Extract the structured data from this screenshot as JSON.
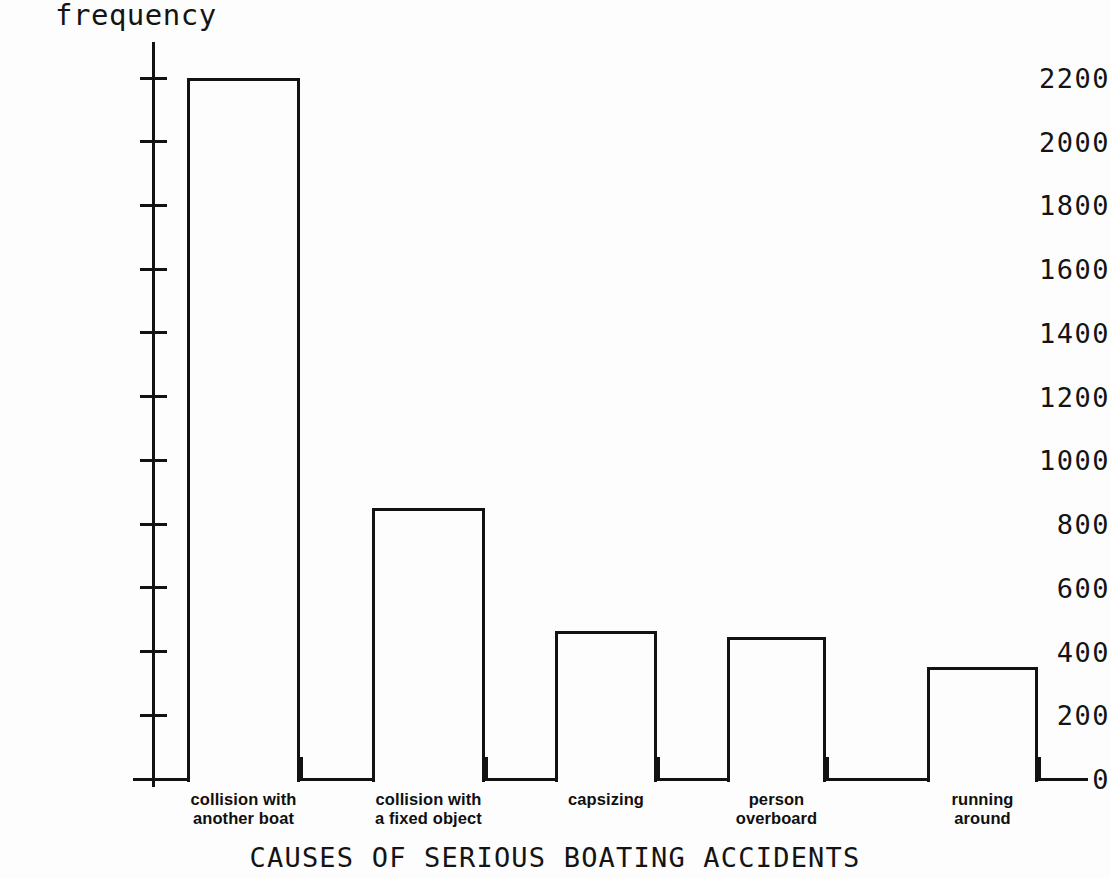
{
  "chart_data": {
    "type": "bar",
    "title": "CAUSES OF SERIOUS BOATING ACCIDENTS",
    "xlabel": "CAUSES OF SERIOUS BOATING ACCIDENTS",
    "ylabel": "frequency",
    "categories": [
      "collision with another boat",
      "collision with a fixed object",
      "capsizing",
      "person overboard",
      "running around"
    ],
    "category_lines": [
      [
        "collision with",
        "another boat"
      ],
      [
        "collision with",
        "a fixed object"
      ],
      [
        "capsizing",
        ""
      ],
      [
        "person",
        "overboard"
      ],
      [
        "running",
        "around"
      ]
    ],
    "values": [
      2200,
      850,
      465,
      445,
      350
    ],
    "ylim": [
      0,
      2200
    ],
    "ytick_values": [
      0,
      200,
      400,
      600,
      800,
      1000,
      1200,
      1400,
      1600,
      1800,
      2000,
      2200
    ],
    "ytick_labels": [
      "0",
      "200",
      "400",
      "600",
      "800",
      "1000",
      "1200",
      "1400",
      "1600",
      "1800",
      "2000",
      "2200"
    ],
    "grid": false,
    "legend": null,
    "colors": {
      "bar_fill": "#fdfdfd",
      "bar_edge": "#121212",
      "axis": "#121212",
      "text": "#141414",
      "background": "#fdfdfd"
    }
  },
  "geometry": {
    "baseline_y": 779,
    "top_value_y": 78,
    "bars_px": [
      {
        "left": 187,
        "width": 113
      },
      {
        "left": 372,
        "width": 113
      },
      {
        "left": 555,
        "width": 102
      },
      {
        "left": 727,
        "width": 99
      },
      {
        "left": 927,
        "width": 111
      }
    ],
    "xtick_px": [
      187,
      300,
      372,
      485,
      555,
      657,
      727,
      826,
      927,
      1038
    ]
  }
}
